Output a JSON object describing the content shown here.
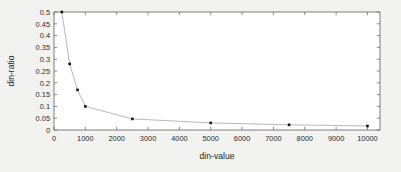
{
  "chart_data": {
    "type": "line",
    "title": "",
    "xlabel": "din-value",
    "ylabel": "din-ratio",
    "xlim": [
      0,
      10400
    ],
    "ylim": [
      0,
      0.5
    ],
    "grid": false,
    "legend": null,
    "marker": "square",
    "line_color": "#b9b9b9",
    "marker_color": "#141414",
    "x": [
      250,
      500,
      750,
      1000,
      2500,
      5000,
      7500,
      10000
    ],
    "values": [
      0.5,
      0.28,
      0.17,
      0.1,
      0.047,
      0.03,
      0.022,
      0.017
    ],
    "series": [
      {
        "name": "din-ratio",
        "x": [
          250,
          500,
          750,
          1000,
          2500,
          5000,
          7500,
          10000
        ],
        "values": [
          0.5,
          0.28,
          0.17,
          0.1,
          0.047,
          0.03,
          0.022,
          0.017
        ]
      }
    ],
    "xticks": [
      0,
      1000,
      2000,
      3000,
      4000,
      5000,
      6000,
      7000,
      8000,
      9000,
      10000
    ],
    "xticklabels": [
      "0",
      "1000",
      "2000",
      "3000",
      "4000",
      "5000",
      "6000",
      "7000",
      "8000",
      "9000",
      "10000"
    ],
    "yticks": [
      0,
      0.05,
      0.1,
      0.15,
      0.2,
      0.25,
      0.3,
      0.35,
      0.4,
      0.45,
      0.5
    ],
    "yticklabels": [
      "0",
      "0.05",
      "0.1",
      "0.15",
      "0.2",
      "0.25",
      "0.3",
      "0.35",
      "0.4",
      "0.45",
      "0.5"
    ]
  },
  "figure": {
    "background_color": "#f2f2f0",
    "plot_background_color": "#ffffff",
    "axis_color": "#6f6f6f"
  }
}
